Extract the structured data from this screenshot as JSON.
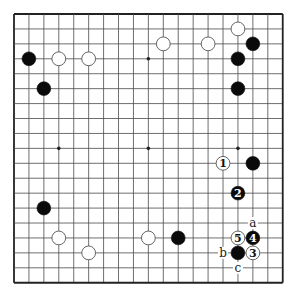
{
  "diagram": {
    "type": "go-board",
    "size": 19,
    "origin": {
      "x": 14,
      "y": 14
    },
    "spacing": 14.93,
    "colors": {
      "line": "#4a4a4a",
      "border": "#222222",
      "black_stone": "#0a0a0a",
      "white_stone": "#ffffff",
      "white_stroke": "#555555",
      "label": "#222222"
    },
    "star_points": [
      [
        3,
        3
      ],
      [
        9,
        3
      ],
      [
        15,
        3
      ],
      [
        3,
        9
      ],
      [
        9,
        9
      ],
      [
        15,
        9
      ],
      [
        3,
        15
      ],
      [
        9,
        15
      ],
      [
        15,
        15
      ]
    ],
    "stones": [
      {
        "color": "black",
        "col": 1,
        "row": 3
      },
      {
        "color": "white",
        "col": 3,
        "row": 3
      },
      {
        "color": "white",
        "col": 5,
        "row": 3
      },
      {
        "color": "black",
        "col": 2,
        "row": 5
      },
      {
        "color": "white",
        "col": 10,
        "row": 2
      },
      {
        "color": "white",
        "col": 13,
        "row": 2
      },
      {
        "color": "white",
        "col": 15,
        "row": 1
      },
      {
        "color": "black",
        "col": 16,
        "row": 2
      },
      {
        "color": "black",
        "col": 15,
        "row": 3
      },
      {
        "color": "black",
        "col": 15,
        "row": 5
      },
      {
        "color": "white",
        "col": 14,
        "row": 10,
        "move": "1"
      },
      {
        "color": "black",
        "col": 16,
        "row": 10
      },
      {
        "color": "black",
        "col": 15,
        "row": 12,
        "move": "2"
      },
      {
        "color": "black",
        "col": 2,
        "row": 13
      },
      {
        "color": "white",
        "col": 3,
        "row": 15
      },
      {
        "color": "white",
        "col": 5,
        "row": 16
      },
      {
        "color": "white",
        "col": 9,
        "row": 15
      },
      {
        "color": "black",
        "col": 11,
        "row": 15
      },
      {
        "color": "white",
        "col": 15,
        "row": 15,
        "move": "5"
      },
      {
        "color": "black",
        "col": 16,
        "row": 15,
        "move": "4"
      },
      {
        "color": "black",
        "col": 15,
        "row": 16
      },
      {
        "color": "white",
        "col": 16,
        "row": 16,
        "move": "3"
      }
    ],
    "labels": [
      {
        "text": "a",
        "col": 16,
        "row": 14
      },
      {
        "text": "b",
        "col": 14,
        "row": 16
      },
      {
        "text": "c",
        "col": 15,
        "row": 17
      }
    ]
  }
}
